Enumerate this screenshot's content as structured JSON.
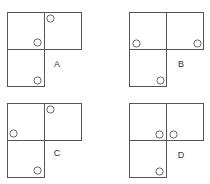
{
  "diagram": {
    "cell_size": 37,
    "circle_radius": 3.6,
    "stroke_color": "#555555",
    "options": [
      {
        "label": "A",
        "origin": [
          7,
          12
        ],
        "label_pos": [
          57,
          67
        ],
        "circles": [
          [
            50,
            18
          ],
          [
            37,
            42
          ],
          [
            37,
            80
          ]
        ]
      },
      {
        "label": "B",
        "origin": [
          129,
          12
        ],
        "label_pos": [
          181,
          67
        ],
        "circles": [
          [
            136,
            43
          ],
          [
            197,
            43
          ],
          [
            160,
            80
          ]
        ]
      },
      {
        "label": "C",
        "origin": [
          7,
          103
        ],
        "label_pos": [
          57,
          156
        ],
        "circles": [
          [
            50,
            109
          ],
          [
            13,
            133
          ],
          [
            37,
            170
          ]
        ]
      },
      {
        "label": "D",
        "origin": [
          129,
          103
        ],
        "label_pos": [
          181,
          158
        ],
        "circles": [
          [
            159,
            134
          ],
          [
            173,
            134
          ],
          [
            159,
            171
          ]
        ]
      }
    ]
  }
}
